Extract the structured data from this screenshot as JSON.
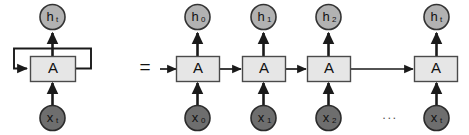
{
  "diagram": {
    "equals_symbol": "=",
    "ellipsis": "...",
    "cell_label": "A",
    "colors": {
      "hidden_node_fill": "#b2b2b2",
      "input_node_fill": "#6e6e6e",
      "cell_fill": "#e6e6e6",
      "stroke": "#1a1a1a",
      "background": "#ffffff"
    },
    "folded": {
      "cell": "A",
      "output": {
        "base": "h",
        "sub": "t"
      },
      "input": {
        "base": "x",
        "sub": "t"
      },
      "loop_label": ""
    },
    "unrolled": {
      "steps": [
        {
          "cell": "A",
          "output": {
            "base": "h",
            "sub": "0"
          },
          "input": {
            "base": "x",
            "sub": "0"
          }
        },
        {
          "cell": "A",
          "output": {
            "base": "h",
            "sub": "1"
          },
          "input": {
            "base": "x",
            "sub": "1"
          }
        },
        {
          "cell": "A",
          "output": {
            "base": "h",
            "sub": "2"
          },
          "input": {
            "base": "x",
            "sub": "2"
          }
        },
        {
          "cell": "A",
          "output": {
            "base": "h",
            "sub": "t"
          },
          "input": {
            "base": "x",
            "sub": "t"
          }
        }
      ]
    }
  }
}
